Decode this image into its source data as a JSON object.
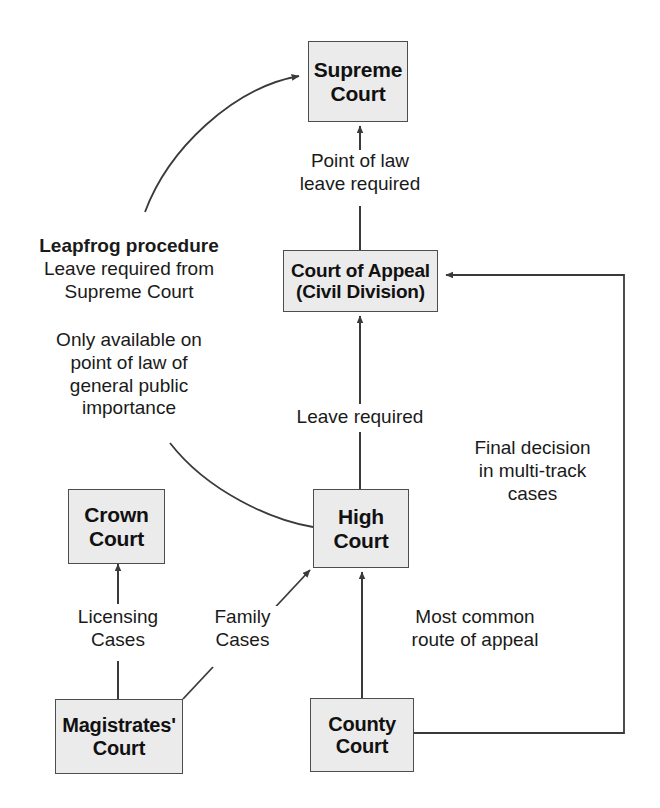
{
  "diagram": {
    "nodes": [
      {
        "id": "supreme",
        "lines": [
          "Supreme",
          "Court"
        ]
      },
      {
        "id": "court_appeal",
        "lines": [
          "Court of Appeal",
          "(Civil Division)"
        ]
      },
      {
        "id": "crown",
        "lines": [
          "Crown",
          "Court"
        ]
      },
      {
        "id": "high",
        "lines": [
          "High",
          "Court"
        ]
      },
      {
        "id": "magistrates",
        "lines": [
          "Magistrates'",
          "Court"
        ]
      },
      {
        "id": "county",
        "lines": [
          "County",
          "Court"
        ]
      }
    ],
    "labels": [
      {
        "id": "point_of_law",
        "lines": [
          "Point of law",
          "leave required"
        ]
      },
      {
        "id": "leapfrog",
        "lines": [
          "Leapfrog procedure",
          "Leave required from",
          "Supreme Court"
        ],
        "bold_first": true
      },
      {
        "id": "only_available",
        "lines": [
          "Only available on",
          "point of law of",
          "general public",
          "importance"
        ]
      },
      {
        "id": "leave_required",
        "lines": [
          "Leave required"
        ]
      },
      {
        "id": "final_decision",
        "lines": [
          "Final decision",
          "in multi-track",
          "cases"
        ]
      },
      {
        "id": "licensing",
        "lines": [
          "Licensing",
          "Cases"
        ]
      },
      {
        "id": "family",
        "lines": [
          "Family",
          "Cases"
        ]
      },
      {
        "id": "most_common",
        "lines": [
          "Most common",
          "route of appeal"
        ]
      }
    ],
    "colors": {
      "node_fill": "#ebebeb",
      "node_border": "#4d4d4d",
      "connector": "#3a3a3a",
      "text": "#1a1a1a",
      "background": "#ffffff"
    }
  }
}
